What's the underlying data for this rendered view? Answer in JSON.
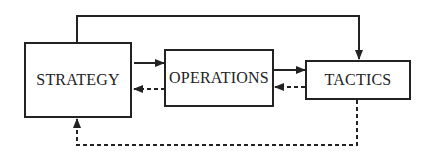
{
  "diagram": {
    "nodes": [
      {
        "id": "strategy",
        "label": "STRATEGY"
      },
      {
        "id": "operations",
        "label": "OPERATIONS"
      },
      {
        "id": "tactics",
        "label": "TACTICS"
      }
    ],
    "edges": [
      {
        "from": "strategy",
        "to": "operations",
        "style": "solid"
      },
      {
        "from": "operations",
        "to": "tactics",
        "style": "solid"
      },
      {
        "from": "strategy",
        "to": "tactics",
        "style": "solid",
        "route": "over-top"
      },
      {
        "from": "operations",
        "to": "strategy",
        "style": "dashed"
      },
      {
        "from": "tactics",
        "to": "operations",
        "style": "dashed"
      },
      {
        "from": "tactics",
        "to": "strategy",
        "style": "dashed",
        "route": "under-bottom"
      }
    ]
  }
}
